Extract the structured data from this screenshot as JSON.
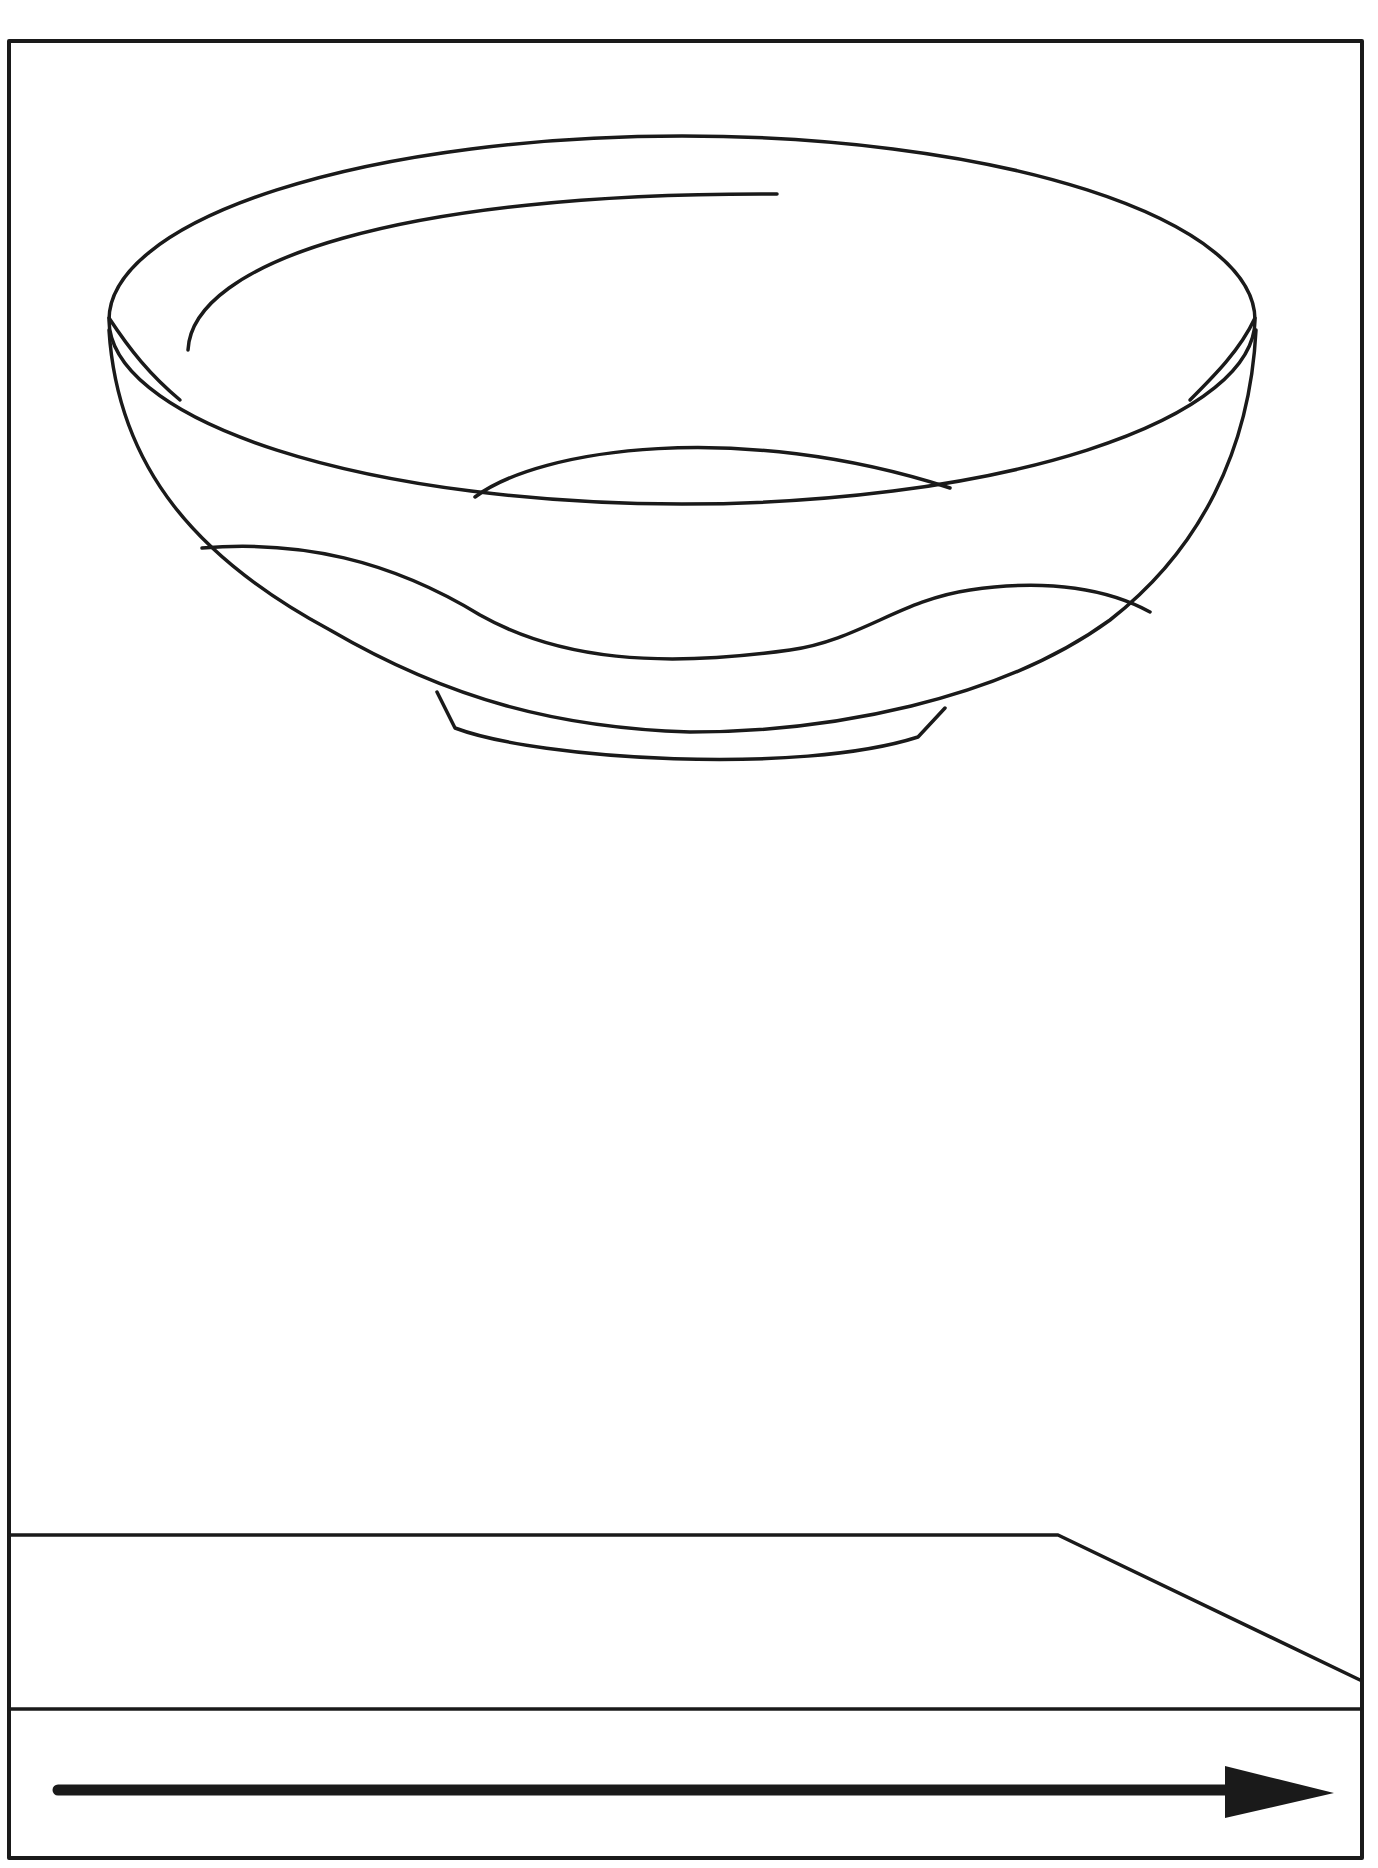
{
  "figure": {
    "description": "Line drawing of a bowl suspended above a surface, with an arrow pointing right along the bottom",
    "colors": {
      "background": "#ffffff",
      "stroke": "#1a1a1a"
    },
    "elements": {
      "frame": "frame",
      "bowl": "bowl",
      "surface": "table-surface",
      "arrow": {
        "direction": "right"
      }
    }
  }
}
